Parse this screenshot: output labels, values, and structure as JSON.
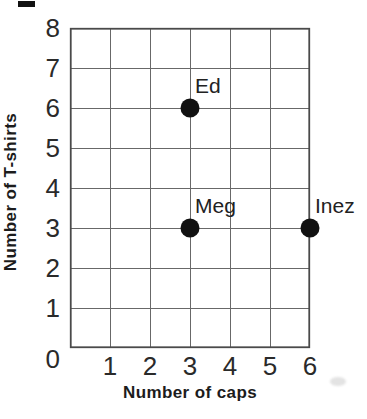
{
  "chart_data": {
    "type": "scatter",
    "title": "",
    "xlabel": "Number of caps",
    "ylabel": "Number of T-shirts",
    "xlim": [
      0,
      6
    ],
    "ylim": [
      0,
      8
    ],
    "xticks": [
      1,
      2,
      3,
      4,
      5,
      6
    ],
    "yticks": [
      8,
      7,
      6,
      5,
      4,
      3,
      2,
      1,
      0
    ],
    "grid": true,
    "legend": false,
    "points": [
      {
        "label": "Ed",
        "x": 3,
        "y": 6
      },
      {
        "label": "Meg",
        "x": 3,
        "y": 3
      },
      {
        "label": "Inez",
        "x": 6,
        "y": 3
      }
    ],
    "colors": {
      "background": "#ffffff",
      "grid_line": "#686868",
      "plot_border": "#4a4a4a",
      "point": "#111111",
      "text": "#1c1c1c"
    }
  }
}
